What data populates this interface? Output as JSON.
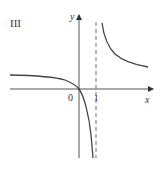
{
  "panel_label": "III",
  "axes": {
    "x_label": "x",
    "y_label": "y",
    "origin_label": "0",
    "tick_label": "1"
  },
  "asymptote": {
    "x": 1,
    "style": "dashed"
  },
  "colors": {
    "curve": "#444444",
    "axis": "#555555",
    "asymptote": "#888888"
  }
}
